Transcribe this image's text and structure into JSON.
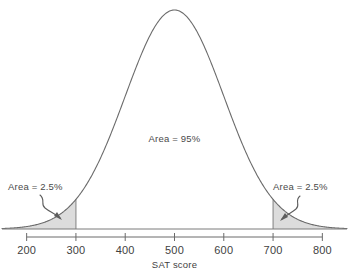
{
  "chart_data": {
    "type": "area",
    "title": "",
    "subtitle": "",
    "xlabel": "SAT score",
    "ylabel": "",
    "distribution": "normal",
    "mean": 500,
    "sd": 100,
    "xlim": [
      150,
      850
    ],
    "xticks": [
      200,
      300,
      400,
      500,
      600,
      700,
      800
    ],
    "xtick_labels": [
      "200",
      "300",
      "400",
      "500",
      "600",
      "700",
      "800"
    ],
    "grid": false,
    "legend": "none",
    "shaded_regions": [
      {
        "name": "left-tail",
        "from": 150,
        "to": 300,
        "area_percent": 2.5,
        "fill": "#dcdcdc"
      },
      {
        "name": "right-tail",
        "from": 700,
        "to": 850,
        "area_percent": 2.5,
        "fill": "#dcdcdc"
      }
    ],
    "annotations": [
      {
        "name": "center-area",
        "text": "Area = 95%",
        "x": 500,
        "y_frac": 0.46
      },
      {
        "name": "left-tail-area",
        "text": "Area = 2.5%",
        "x": 243,
        "y_frac": 0.2
      },
      {
        "name": "right-tail-area",
        "text": "Area = 2.5%",
        "x": 760,
        "y_frac": 0.2
      }
    ]
  },
  "labels": {
    "axis_title": "SAT score",
    "center_area": "Area = 95%",
    "left_area": "Area = 2.5%",
    "right_area": "Area = 2.5%",
    "tick_200": "200",
    "tick_300": "300",
    "tick_400": "400",
    "tick_500": "500",
    "tick_600": "600",
    "tick_700": "700",
    "tick_800": "800"
  },
  "colors": {
    "curve": "#6b6b6b",
    "shade": "#dcdcdc",
    "text": "#3f3f3f",
    "axis": "#6b6b6b",
    "background": "#ffffff"
  }
}
